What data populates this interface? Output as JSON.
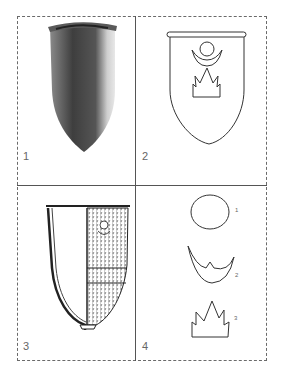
{
  "figure": {
    "panels": [
      {
        "id": "1",
        "label": "1",
        "description": "photograph of conical glass vessel"
      },
      {
        "id": "2",
        "label": "2",
        "description": "outline drawing of vessel with sun, crescent and flame motif"
      },
      {
        "id": "3",
        "label": "3",
        "description": "section drawing of vessel with decorated half"
      },
      {
        "id": "4",
        "label": "4",
        "description": "motif details"
      }
    ],
    "motifs": [
      {
        "label": "1",
        "name": "circle"
      },
      {
        "label": "2",
        "name": "crescent"
      },
      {
        "label": "3",
        "name": "flame"
      }
    ]
  }
}
